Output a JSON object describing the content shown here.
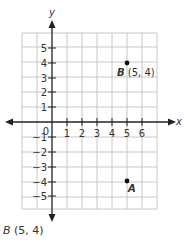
{
  "diagram": {
    "type": "coordinate-plane",
    "axes": {
      "x_label": "x",
      "y_label": "y"
    },
    "origin_label": "0",
    "x_ticks": [
      "1",
      "2",
      "3",
      "4",
      "5",
      "6"
    ],
    "y_ticks_positive": [
      "1",
      "2",
      "3",
      "4",
      "5"
    ],
    "y_ticks_negative": [
      "−1",
      "−2",
      "−3",
      "−4",
      "−5"
    ],
    "points": [
      {
        "name": "B",
        "label_coords": "(5, 4)",
        "x": 5,
        "y": 4
      },
      {
        "name": "A",
        "x": 5,
        "y": -4
      }
    ],
    "colors": {
      "grid": "#c8c8c8",
      "axis": "#222222",
      "point": "#111111",
      "text": "#333333"
    }
  },
  "caption": {
    "point": "B",
    "coords": "(5, 4)"
  }
}
